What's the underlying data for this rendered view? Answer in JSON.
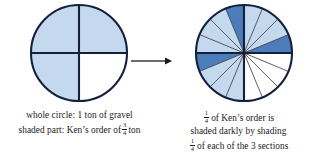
{
  "figure": {
    "colors": {
      "light_shade": "#c5d9ee",
      "dark_shade": "#4c7cba",
      "outline": "#14213d",
      "thin_line": "#2b2b2b",
      "background": "#ffffff",
      "text": "#1a1a1a"
    }
  },
  "left_panel": {
    "diagram": {
      "name": "whole-circle-quarters",
      "total_sectors": 4,
      "shaded_sectors": 3,
      "unshaded_sectors": 1,
      "unshaded_position": "bottom-right",
      "shade_color": "#c5d9ee"
    },
    "caption": {
      "line1": "whole circle: 1 ton of gravel",
      "line2_before": "shaded part: Ken’s order of",
      "line2_fraction": {
        "numerator": "3",
        "denominator": "4"
      },
      "line2_after": "ton"
    }
  },
  "right_panel": {
    "diagram": {
      "name": "circle-sixteenths",
      "total_sectors": 16,
      "sectors_per_quarter": 4,
      "light_shaded_quarters": 3,
      "unshaded_quarter": "bottom-right",
      "dark_sectors": 3,
      "dark_sector_positions": [
        "top-left-quarter",
        "top-right-quarter",
        "bottom-left-quarter"
      ],
      "light_color": "#c5d9ee",
      "dark_color": "#4c7cba"
    },
    "caption": {
      "line1_fraction": {
        "numerator": "1",
        "denominator": "4"
      },
      "line1_after": "of Ken’s order is",
      "line2": "shaded darkly by shading",
      "line3_fraction": {
        "numerator": "1",
        "denominator": "4"
      },
      "line3_after": "of each of the 3 sections"
    }
  },
  "arrow": {
    "name": "transformation-arrow",
    "direction": "right"
  }
}
